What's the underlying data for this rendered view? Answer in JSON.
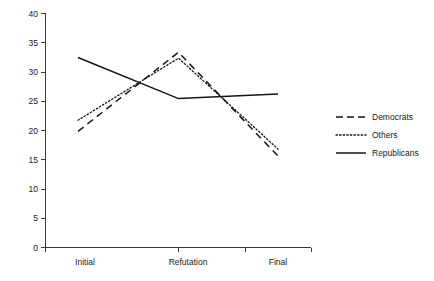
{
  "chart_data": {
    "type": "line",
    "title": "",
    "subtitle": "",
    "xlabel": "",
    "ylabel": "",
    "categories": [
      "Initial",
      "Refutation",
      "Final"
    ],
    "xticks": [
      "Initial",
      "Refutation",
      "Final"
    ],
    "yticks": [
      "0",
      "5",
      "10",
      "15",
      "20",
      "25",
      "30",
      "35",
      "40"
    ],
    "ytick_values": [
      0,
      5,
      10,
      15,
      20,
      25,
      30,
      35,
      40
    ],
    "ylim": [
      0,
      40
    ],
    "grid": false,
    "legend_position": "right",
    "series": [
      {
        "name": "Democrats",
        "values": [
          19.8,
          33.3,
          15.6
        ],
        "style": "dashed",
        "color": "#141414"
      },
      {
        "name": "Others",
        "values": [
          21.7,
          32.3,
          16.8
        ],
        "style": "dotted",
        "color": "#141414"
      },
      {
        "name": "Republicans",
        "values": [
          32.4,
          25.4,
          26.2
        ],
        "style": "solid",
        "color": "#141414"
      }
    ]
  },
  "legend": {
    "items": [
      {
        "label": "Democrats",
        "style": "dashed"
      },
      {
        "label": "Others",
        "style": "dotted"
      },
      {
        "label": "Republicans",
        "style": "solid"
      }
    ]
  },
  "axes": {
    "y": {
      "labels": [
        "40",
        "35",
        "30",
        "25",
        "20",
        "15",
        "10",
        "5",
        "0"
      ]
    },
    "x": {
      "labels": [
        "Initial",
        "Refutation",
        "Final"
      ]
    }
  }
}
